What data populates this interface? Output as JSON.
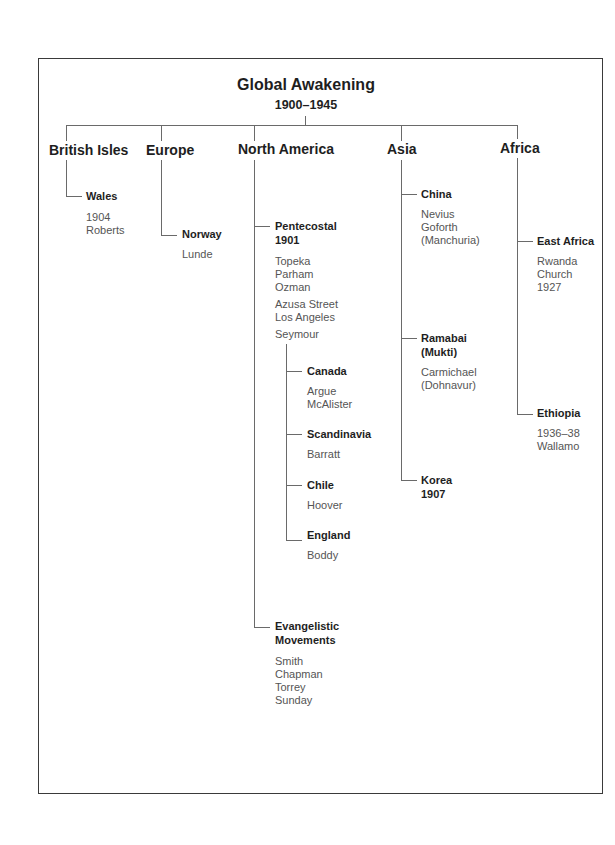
{
  "title": "Global Awakening",
  "subtitle": "1900–1945",
  "regions": [
    {
      "label": "British Isles",
      "children": [
        {
          "label": "Wales",
          "details": [
            "1904",
            "Roberts"
          ]
        }
      ]
    },
    {
      "label": "Europe",
      "children": [
        {
          "label": "Norway",
          "details": [
            "Lunde"
          ]
        }
      ]
    },
    {
      "label": "North America",
      "children": [
        {
          "label": "Pentecostal",
          "label2": "1901",
          "details": [
            "Topeka",
            "Parham",
            "Ozman"
          ],
          "details2": [
            "Azusa Street",
            "Los Angeles"
          ],
          "details3": [
            "Seymour"
          ],
          "children": [
            {
              "label": "Canada",
              "details": [
                "Argue",
                "McAlister"
              ]
            },
            {
              "label": "Scandinavia",
              "details": [
                "Barratt"
              ]
            },
            {
              "label": "Chile",
              "details": [
                "Hoover"
              ]
            },
            {
              "label": "England",
              "details": [
                "Boddy"
              ]
            }
          ]
        },
        {
          "label": "Evangelistic",
          "label2": "Movements",
          "details": [
            "Smith",
            "Chapman",
            "Torrey",
            "Sunday"
          ]
        }
      ]
    },
    {
      "label": "Asia",
      "children": [
        {
          "label": "China",
          "details": [
            "Nevius",
            "Goforth",
            "(Manchuria)"
          ]
        },
        {
          "label": "Ramabai",
          "label2": "(Mukti)",
          "details": [
            "Carmichael",
            "(Dohnavur)"
          ]
        },
        {
          "label": "Korea",
          "label2": "1907",
          "details": []
        }
      ]
    },
    {
      "label": "Africa",
      "children": [
        {
          "label": "East Africa",
          "details": [
            "Rwanda",
            "Church",
            "1927"
          ]
        },
        {
          "label": "Ethiopia",
          "details": [
            "1936–38",
            "Wallamo"
          ]
        }
      ]
    }
  ]
}
